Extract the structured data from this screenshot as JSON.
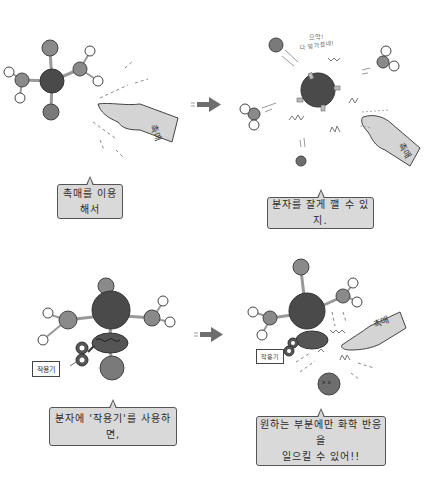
{
  "panels": [
    {
      "id": "panel-1",
      "caption": "촉매를 이용해서",
      "hand_label": "촉매"
    },
    {
      "id": "panel-2",
      "caption": "분자를 잘게 깰 수 있지.",
      "shout_line1": "으악!",
      "shout_line2": "다 망가졌네!",
      "hand_label": "촉매"
    },
    {
      "id": "panel-3",
      "caption": "분자에 '작용기'를 사용하면,",
      "tag_label": "작용기"
    },
    {
      "id": "panel-4",
      "caption_line1": "원하는 부분에만 화학 반응을",
      "caption_line2": "일으킬 수 있어!!",
      "tag_label": "작용기",
      "hand_label": "촉매"
    }
  ],
  "colors": {
    "central_atom": "#4a4a4a",
    "side_atom": "#8a8a8a",
    "hydrogen": "#ffffff",
    "hand": "#d4d4d4",
    "caption_bg": "#d9d9d9",
    "arrow": "#6e6e6e"
  }
}
